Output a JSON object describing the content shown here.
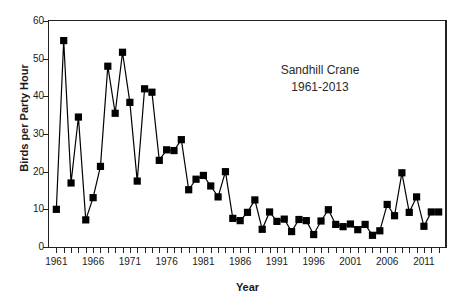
{
  "chart_data": {
    "type": "line",
    "title": "Sandhill Crane",
    "subtitle": "1961-2013",
    "xlabel": "Year",
    "ylabel": "Birds per Party Hour",
    "xlim": [
      1960,
      2014
    ],
    "ylim": [
      0,
      60
    ],
    "yticks": [
      0,
      10,
      20,
      30,
      40,
      50,
      60
    ],
    "xticks": [
      1961,
      1966,
      1971,
      1976,
      1981,
      1986,
      1991,
      1996,
      2001,
      2006,
      2011
    ],
    "grid": false,
    "legend": false,
    "marker": "square",
    "marker_color": "#000000",
    "line_color": "#000000",
    "x": [
      1961,
      1962,
      1963,
      1964,
      1965,
      1966,
      1967,
      1968,
      1969,
      1970,
      1971,
      1972,
      1973,
      1974,
      1975,
      1976,
      1977,
      1978,
      1979,
      1980,
      1981,
      1982,
      1983,
      1984,
      1985,
      1986,
      1987,
      1988,
      1989,
      1990,
      1991,
      1992,
      1993,
      1994,
      1995,
      1996,
      1997,
      1998,
      1999,
      2000,
      2001,
      2002,
      2003,
      2004,
      2005,
      2006,
      2007,
      2008,
      2009,
      2010,
      2011,
      2012,
      2013
    ],
    "y": [
      10.0,
      54.8,
      17.0,
      34.5,
      7.2,
      13.1,
      21.4,
      48.0,
      35.5,
      51.7,
      38.4,
      17.5,
      42.0,
      41.1,
      23.0,
      25.8,
      25.6,
      28.5,
      15.2,
      18.0,
      19.0,
      16.2,
      13.3,
      20.0,
      7.6,
      7.0,
      9.2,
      12.5,
      4.7,
      9.3,
      6.8,
      7.4,
      4.1,
      7.3,
      7.0,
      3.3,
      6.9,
      9.9,
      6.0,
      5.4,
      6.1,
      4.6,
      6.0,
      3.1,
      4.3,
      11.3,
      8.3,
      19.7,
      9.2,
      13.3,
      5.5,
      9.3,
      9.3
    ]
  },
  "figure": {
    "annotation_line1": "Sandhill Crane",
    "annotation_line2": "1961-2013",
    "axis_x_title": "Year",
    "axis_y_title": "Birds per Party Hour"
  }
}
